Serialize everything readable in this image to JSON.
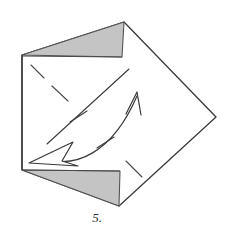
{
  "figure": {
    "kind": "origami-fold-diagram",
    "step_label": "5.",
    "canvas": {
      "width": 236,
      "height": 235
    },
    "background_color": "#ffffff",
    "line_color": "#3a3a3a",
    "shaded_color": "#c4c4c4",
    "shaded_edge_color": "#555555",
    "paper_color": "#ffffff"
  },
  "shapes": {
    "paper_outline": {
      "name": "folded-paper-outline",
      "points": "22,55 124,22 216,117 119,206 22,170",
      "description": "Outer silhouette of the folded paper: a tilted square with a vertical left edge"
    },
    "left_edge": {
      "name": "left-vertical-edge",
      "x1": 22,
      "y1": 55,
      "x2": 22,
      "y2": 170
    },
    "top_shaded_triangle": {
      "name": "top-shaded-flap",
      "points": "22,55 124,22 122,57",
      "fill": "#c4c4c4"
    },
    "bottom_shaded_triangle": {
      "name": "bottom-shaded-flap",
      "points": "22,170 120,171 119,206",
      "fill": "#c4c4c4"
    },
    "top_flap_edge": {
      "name": "top-flap-horizontal-edge",
      "x1": 22,
      "y1": 56,
      "x2": 122,
      "y2": 57
    },
    "bottom_flap_edge": {
      "name": "bottom-flap-horizontal-edge",
      "x1": 22,
      "y1": 170,
      "x2": 120,
      "y2": 171
    }
  },
  "creases": {
    "main_diagonal": {
      "name": "main-crease-diagonal",
      "x1": 47,
      "y1": 144,
      "x2": 129,
      "y2": 69,
      "style": "solid"
    },
    "dashes": [
      {
        "name": "dash-upper-left-1",
        "x1": 31,
        "y1": 65,
        "x2": 44,
        "y2": 78
      },
      {
        "name": "dash-upper-left-2",
        "x1": 52,
        "y1": 86,
        "x2": 68,
        "y2": 101
      },
      {
        "name": "dash-lower-right-1",
        "x1": 126,
        "y1": 161,
        "x2": 142,
        "y2": 177
      }
    ],
    "tick_marks": [
      {
        "name": "tick-on-diagonal",
        "x1": 70,
        "y1": 122,
        "x2": 87,
        "y2": 111
      },
      {
        "name": "tick-on-arc",
        "x1": 97,
        "y1": 148,
        "x2": 114,
        "y2": 137
      }
    ]
  },
  "arrows": {
    "fold_arc": {
      "name": "fold-direction-arc",
      "path": "M 46,159 C 75,168 112,154 137,96",
      "description": "Curved arrow sweeping from lower-left up to the right"
    },
    "tip_arrowhead": {
      "name": "arrowhead-up-right",
      "points": "137,92 129,111 136,106 140,113",
      "style": "thin-open-v",
      "direction": "up-right"
    },
    "hollow_arrowhead": {
      "name": "arrowhead-hollow-left",
      "points": "29,162 71,143 63,162 76,166",
      "style": "hollow-outline",
      "direction": "left-down"
    }
  },
  "label": {
    "name": "step-number",
    "text": "5.",
    "x": 97,
    "y": 222
  }
}
